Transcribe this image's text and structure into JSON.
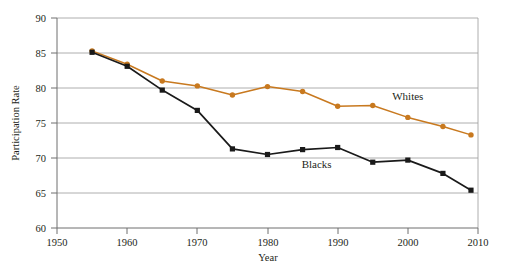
{
  "chart_data": {
    "type": "line",
    "title": "",
    "xlabel": "Year",
    "ylabel": "Participation Rate",
    "xlim": [
      1950,
      2010
    ],
    "ylim": [
      60,
      90
    ],
    "grid": true,
    "legend_position": "inline-annotation",
    "x_ticks": [
      1950,
      1960,
      1970,
      1980,
      1990,
      2000,
      2010
    ],
    "y_ticks": [
      60,
      65,
      70,
      75,
      80,
      85,
      90
    ],
    "x": [
      1955,
      1960,
      1965,
      1970,
      1975,
      1980,
      1985,
      1990,
      1995,
      2000,
      2005,
      2009
    ],
    "series": [
      {
        "name": "Whites",
        "color": "#c8791f",
        "marker": "circle",
        "values": [
          85.3,
          83.4,
          81.0,
          80.3,
          79.0,
          80.2,
          79.5,
          77.4,
          77.5,
          75.8,
          74.5,
          73.3
        ]
      },
      {
        "name": "Blacks",
        "color": "#1a1a1a",
        "marker": "square",
        "values": [
          85.1,
          83.1,
          79.7,
          76.8,
          71.3,
          70.5,
          71.2,
          71.5,
          69.4,
          69.7,
          67.8,
          65.4
        ]
      }
    ],
    "annotations": [
      {
        "text": "Whites",
        "x": 2000,
        "y": 78.3
      },
      {
        "text": "Blacks",
        "x": 1987,
        "y": 68.6
      }
    ]
  },
  "axis": {
    "y_tick_labels": [
      "90",
      "85",
      "80",
      "75",
      "70",
      "65",
      "60"
    ],
    "x_tick_labels": [
      "1950",
      "1960",
      "1970",
      "1980",
      "1990",
      "2000",
      "2010"
    ],
    "y_title": "Participation Rate",
    "x_title": "Year"
  },
  "labels": {
    "whites": "Whites",
    "blacks": "Blacks"
  },
  "colors": {
    "whites_line": "#c8791f",
    "blacks_line": "#1a1a1a",
    "gridline": "#9a9a9a",
    "axis": "#6e6e6e",
    "text": "#231f20",
    "background": "#ffffff"
  },
  "top_edge_text": ""
}
